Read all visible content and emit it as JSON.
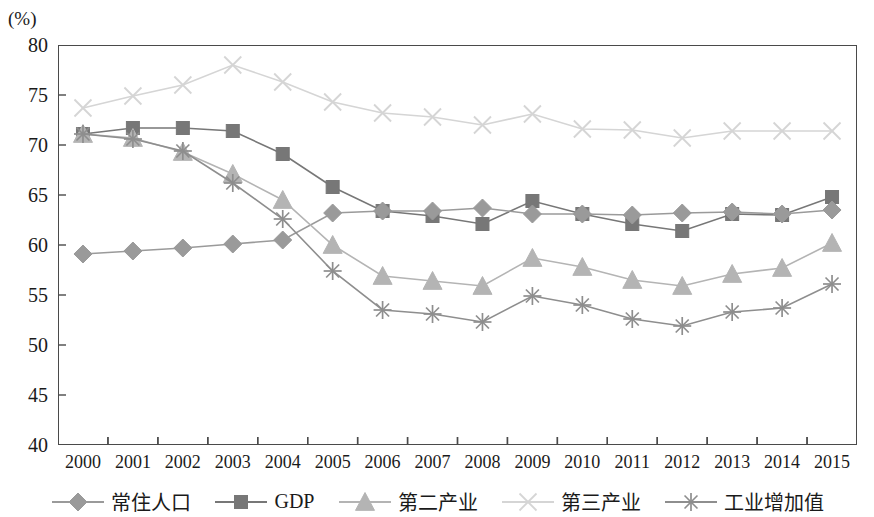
{
  "axis_unit_label": "(%)",
  "chart_data": {
    "type": "line",
    "title": "",
    "xlabel": "",
    "ylabel": "(%)",
    "ylim": [
      40,
      80
    ],
    "ytick_values": [
      40,
      45,
      50,
      55,
      60,
      65,
      70,
      75,
      80
    ],
    "ytick_labels": [
      "40",
      "45",
      "50",
      "55",
      "60",
      "65",
      "70",
      "75",
      "80"
    ],
    "grid": false,
    "legend_position": "bottom",
    "categories": [
      "2000",
      "2001",
      "2002",
      "2003",
      "2004",
      "2005",
      "2006",
      "2007",
      "2008",
      "2009",
      "2010",
      "2011",
      "2012",
      "2013",
      "2014",
      "2015"
    ],
    "series": [
      {
        "name": "常住人口",
        "marker": "diamond",
        "color": "#9a9a9a",
        "values": [
          59.1,
          59.4,
          59.7,
          60.1,
          60.5,
          63.2,
          63.4,
          63.4,
          63.7,
          63.1,
          63.1,
          63.0,
          63.2,
          63.3,
          63.1,
          63.5
        ]
      },
      {
        "name": "GDP",
        "marker": "square",
        "color": "#777777",
        "values": [
          71.1,
          71.7,
          71.7,
          71.4,
          69.1,
          65.8,
          63.4,
          62.9,
          62.1,
          64.4,
          63.1,
          62.1,
          61.4,
          63.1,
          63.0,
          64.8
        ]
      },
      {
        "name": "第二产业",
        "marker": "triangle",
        "color": "#b4b4b4",
        "values": [
          71.1,
          70.7,
          69.3,
          67.1,
          64.5,
          60.0,
          56.9,
          56.4,
          55.9,
          58.7,
          57.8,
          56.5,
          55.9,
          57.1,
          57.7,
          60.2
        ]
      },
      {
        "name": "第三产业",
        "marker": "x",
        "color": "#d5d5d5",
        "values": [
          73.7,
          74.9,
          76.0,
          78.0,
          76.3,
          74.3,
          73.2,
          72.8,
          72.0,
          73.1,
          71.6,
          71.5,
          70.7,
          71.4,
          71.4,
          71.4
        ]
      },
      {
        "name": "工业增加值",
        "marker": "asterisk",
        "color": "#8e8e8e",
        "values": [
          71.1,
          70.6,
          69.4,
          66.2,
          62.6,
          57.4,
          53.5,
          53.1,
          52.3,
          54.9,
          54.0,
          52.6,
          51.9,
          53.3,
          53.7,
          56.1
        ]
      }
    ]
  }
}
